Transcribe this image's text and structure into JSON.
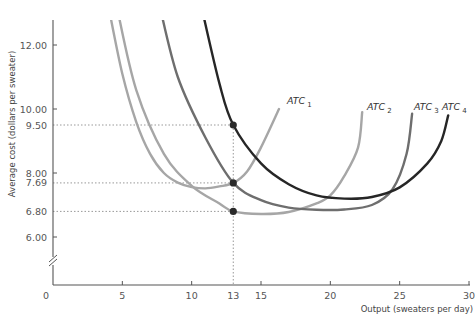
{
  "chart_data": {
    "type": "line",
    "title": "",
    "xlabel": "Output (sweaters per day)",
    "ylabel": "Average cost (dollars per sweater)",
    "xlim": [
      0,
      30
    ],
    "ylim_visible": [
      5.0,
      13.0
    ],
    "y_axis_break": true,
    "x_ticks": [
      0,
      5,
      10,
      13,
      15,
      20,
      25,
      30
    ],
    "x_tick_labels": [
      "0",
      "5",
      "10",
      "13",
      "15",
      "20",
      "25",
      "30"
    ],
    "y_ticks": [
      6.0,
      6.8,
      7.69,
      8.0,
      9.5,
      10.0,
      12.0
    ],
    "y_tick_labels": [
      "6.00",
      "6.80",
      "7.69",
      "8.00",
      "9.50",
      "10.00",
      "12.00"
    ],
    "grid": false,
    "legend": "inline labels at curve ends",
    "series": [
      {
        "name": "ATC1",
        "label_main": "ATC",
        "label_sub": "1",
        "color": "#a6a6a6",
        "points": [
          [
            4.0,
            13.2
          ],
          [
            5.0,
            11.1
          ],
          [
            6.0,
            9.6
          ],
          [
            7.0,
            8.6
          ],
          [
            8.0,
            8.0
          ],
          [
            9.0,
            7.7
          ],
          [
            10.0,
            7.56
          ],
          [
            11.0,
            7.52
          ],
          [
            12.0,
            7.58
          ],
          [
            13.0,
            7.69
          ],
          [
            14.0,
            8.05
          ],
          [
            15.0,
            8.8
          ],
          [
            16.3,
            10.0
          ]
        ]
      },
      {
        "name": "ATC2",
        "label_main": "ATC",
        "label_sub": "2",
        "color": "#a6a6a6",
        "points": [
          [
            4.6,
            13.2
          ],
          [
            6.0,
            10.6
          ],
          [
            8.0,
            8.6
          ],
          [
            10.0,
            7.6
          ],
          [
            12.0,
            7.05
          ],
          [
            13.0,
            6.8
          ],
          [
            15.0,
            6.72
          ],
          [
            17.0,
            6.78
          ],
          [
            19.0,
            7.05
          ],
          [
            20.0,
            7.3
          ],
          [
            21.0,
            7.9
          ],
          [
            22.0,
            8.8
          ],
          [
            22.3,
            9.9
          ]
        ]
      },
      {
        "name": "ATC3",
        "label_main": "ATC",
        "label_sub": "3",
        "color": "#6e6e6e",
        "points": [
          [
            7.7,
            13.2
          ],
          [
            9.0,
            11.0
          ],
          [
            11.0,
            9.1
          ],
          [
            13.0,
            7.69
          ],
          [
            15.0,
            7.15
          ],
          [
            17.0,
            6.92
          ],
          [
            19.0,
            6.85
          ],
          [
            21.0,
            6.86
          ],
          [
            23.0,
            7.0
          ],
          [
            24.5,
            7.5
          ],
          [
            25.5,
            8.6
          ],
          [
            25.9,
            9.85
          ]
        ]
      },
      {
        "name": "ATC4",
        "label_main": "ATC",
        "label_sub": "4",
        "color": "#262626",
        "points": [
          [
            10.7,
            13.2
          ],
          [
            12.0,
            10.8
          ],
          [
            13.0,
            9.5
          ],
          [
            15.0,
            8.3
          ],
          [
            17.0,
            7.65
          ],
          [
            19.0,
            7.3
          ],
          [
            21.0,
            7.2
          ],
          [
            23.0,
            7.25
          ],
          [
            25.0,
            7.55
          ],
          [
            27.0,
            8.3
          ],
          [
            28.0,
            9.0
          ],
          [
            28.5,
            9.8
          ]
        ]
      }
    ],
    "highlighted_points": [
      {
        "x": 13,
        "y": 9.5,
        "curve": "ATC4"
      },
      {
        "x": 13,
        "y": 7.69,
        "curve": "ATC1/ATC3"
      },
      {
        "x": 13,
        "y": 6.8,
        "curve": "ATC2"
      }
    ],
    "reference_lines": {
      "vertical_x": 13,
      "horizontal_y": [
        9.5,
        7.69,
        6.8
      ]
    }
  },
  "axes": {
    "x_title": "Output (sweaters per day)",
    "y_title": "Average cost (dollars per sweater)",
    "origin_label": "0"
  }
}
